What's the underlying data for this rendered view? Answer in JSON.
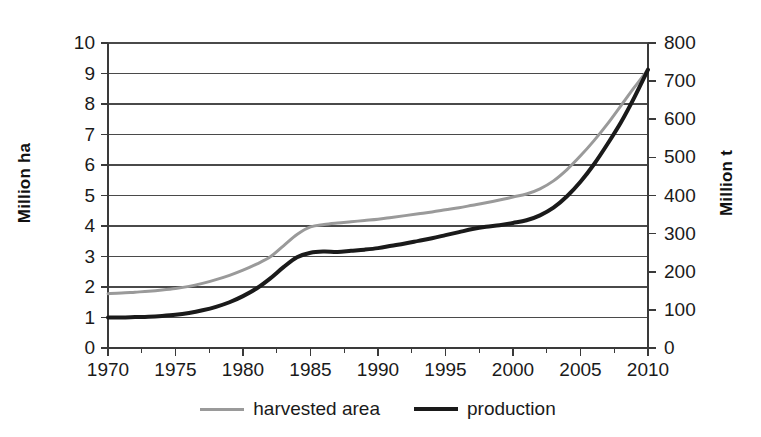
{
  "chart_data": {
    "type": "line",
    "title": "",
    "xlabel": "",
    "ylabel": "Million ha",
    "ylabel_right": "Million t",
    "grid": true,
    "legend_position": "bottom",
    "x": [
      1970,
      1971,
      1972,
      1973,
      1974,
      1975,
      1976,
      1977,
      1978,
      1979,
      1980,
      1981,
      1982,
      1983,
      1984,
      1985,
      1986,
      1987,
      1988,
      1989,
      1990,
      1991,
      1992,
      1993,
      1994,
      1995,
      1996,
      1997,
      1998,
      1999,
      2000,
      2001,
      2002,
      2003,
      2004,
      2005,
      2006,
      2007,
      2008,
      2009,
      2010
    ],
    "xlim": [
      1970,
      2010
    ],
    "xticks": [
      1970,
      1975,
      1980,
      1985,
      1990,
      1995,
      2000,
      2005,
      2010
    ],
    "ylim": [
      0,
      10
    ],
    "yticks": [
      0,
      1,
      2,
      3,
      4,
      5,
      6,
      7,
      8,
      9,
      10
    ],
    "ylim_right": [
      0,
      800
    ],
    "yticks_right": [
      0,
      100,
      200,
      300,
      400,
      500,
      600,
      700,
      800
    ],
    "right_axis_scale_factor": 80,
    "series": [
      {
        "name": "harvested area",
        "axis": "left",
        "unit": "Million ha",
        "color": "#9a9a9a",
        "line_width": 3,
        "values": [
          1.78,
          1.8,
          1.83,
          1.86,
          1.9,
          1.95,
          2.02,
          2.12,
          2.24,
          2.38,
          2.55,
          2.75,
          2.98,
          3.35,
          3.72,
          3.97,
          4.05,
          4.1,
          4.14,
          4.18,
          4.22,
          4.28,
          4.34,
          4.4,
          4.46,
          4.53,
          4.6,
          4.68,
          4.76,
          4.85,
          4.95,
          5.05,
          5.22,
          5.48,
          5.85,
          6.3,
          6.8,
          7.35,
          7.95,
          8.55,
          9.13
        ]
      },
      {
        "name": "production",
        "axis": "right",
        "unit": "Million t",
        "color": "#1a1a1a",
        "line_width": 4,
        "values": [
          80,
          80,
          81,
          82,
          84,
          87,
          92,
          99,
          108,
          120,
          136,
          156,
          182,
          212,
          238,
          250,
          253,
          252,
          255,
          258,
          262,
          268,
          274,
          281,
          288,
          296,
          304,
          312,
          318,
          322,
          328,
          335,
          348,
          368,
          398,
          436,
          482,
          535,
          592,
          658,
          730
        ]
      }
    ]
  },
  "axes": {
    "left": {
      "title": "Million ha",
      "tick_labels": [
        "10",
        "9",
        "8",
        "7",
        "6",
        "5",
        "4",
        "3",
        "2",
        "1",
        "0"
      ]
    },
    "right": {
      "title": "Million t",
      "tick_labels": [
        "800",
        "700",
        "600",
        "500",
        "400",
        "300",
        "200",
        "100",
        "0"
      ]
    },
    "bottom": {
      "tick_labels": [
        "1970",
        "1975",
        "1980",
        "1985",
        "1990",
        "1995",
        "2000",
        "2005",
        "2010"
      ]
    }
  },
  "legend": {
    "items": [
      {
        "label": "harvested area",
        "color": "#9a9a9a"
      },
      {
        "label": "production",
        "color": "#1a1a1a"
      }
    ]
  },
  "style": {
    "background": "#ffffff",
    "axis_color": "#3a3a3a",
    "grid_color": "#4a4a4a",
    "text_color": "#1a1a1a"
  }
}
